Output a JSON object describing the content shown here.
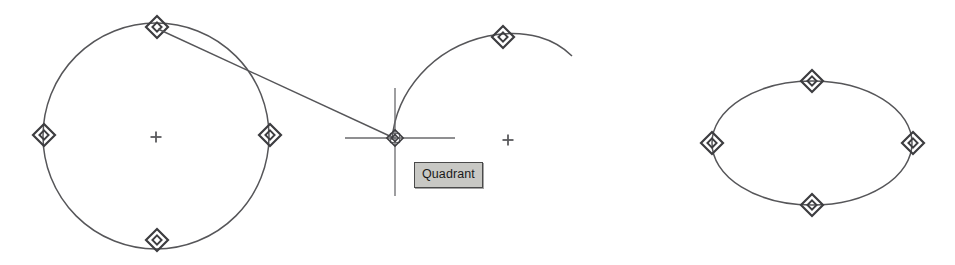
{
  "canvas": {
    "width": 955,
    "height": 265,
    "background_color": "#ffffff",
    "stroke_color": "#4f4f52",
    "marker_color": "#3d3d40"
  },
  "tooltip": {
    "label": "Quadrant",
    "x": 414,
    "y": 162,
    "background_color": "#c8c8c4",
    "border_color": "#4a4a4a",
    "text_color": "#1a1a1a"
  },
  "cursor": {
    "name": "crosshair-pickbox",
    "x": 395,
    "y": 138,
    "h_start_x": 345,
    "h_end_x": 455,
    "v_start_y": 88,
    "v_end_y": 196,
    "pickbox_size": 9
  },
  "entities": {
    "circle": {
      "name": "circle",
      "cx": 156,
      "cy": 136,
      "r": 113,
      "center_mark": {
        "x": 156,
        "y": 137,
        "size": 11
      },
      "quadrant_markers": [
        {
          "label": "top",
          "x": 157,
          "y": 27
        },
        {
          "label": "left",
          "x": 44,
          "y": 135
        },
        {
          "label": "right",
          "x": 270,
          "y": 135
        },
        {
          "label": "bottom",
          "x": 157,
          "y": 240
        }
      ]
    },
    "line": {
      "name": "rubber-band-line",
      "x1": 158,
      "y1": 29,
      "x2": 394,
      "y2": 138
    },
    "arc": {
      "name": "arc",
      "path": "M 392 140 C 396 92, 432 48, 488 36 C 528 28, 556 40, 572 56",
      "center_mark": {
        "x": 508,
        "y": 140,
        "size": 11
      },
      "quadrant_markers": [
        {
          "label": "arc-top",
          "x": 503,
          "y": 37
        }
      ]
    },
    "ellipse": {
      "name": "ellipse",
      "cx": 812,
      "cy": 143,
      "rx": 100,
      "ry": 62,
      "quadrant_markers": [
        {
          "label": "top",
          "x": 812,
          "y": 81
        },
        {
          "label": "left",
          "x": 712,
          "y": 143
        },
        {
          "label": "right",
          "x": 913,
          "y": 143
        },
        {
          "label": "bottom",
          "x": 812,
          "y": 205
        }
      ]
    }
  }
}
